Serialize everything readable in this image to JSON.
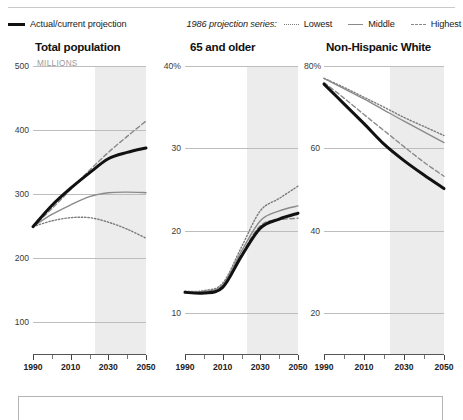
{
  "legend": {
    "actual_label": "Actual/current projection",
    "series_group_label": "1986 projection series:",
    "lowest_label": "Lowest",
    "middle_label": "Middle",
    "highest_label": "Highest"
  },
  "colors": {
    "actual": "#111111",
    "middle": "#8a8a8a",
    "lowest": "#7a7a7a",
    "highest": "#8a8a8a",
    "gridline": "#bdbdbd",
    "shade": "#ececec",
    "subtitle": "#9b9b9b"
  },
  "chart_data": [
    {
      "type": "line",
      "title": "Total population",
      "subtitle": "MILLIONS",
      "xlabel": "",
      "ylabel": "MILLIONS",
      "xlim": [
        1990,
        2050
      ],
      "ylim": [
        50,
        500
      ],
      "yticks": [
        500,
        400,
        300,
        200,
        100
      ],
      "ytick_labels": [
        "500",
        "400",
        "300",
        "200",
        "100"
      ],
      "xticks": [
        1990,
        2000,
        2010,
        2020,
        2030,
        2040,
        2050
      ],
      "xtick_labels": [
        "1990",
        "",
        "2010",
        "",
        "2030",
        "",
        "2050"
      ],
      "grid": true,
      "projection_shade_start": 2023,
      "x": [
        1990,
        2000,
        2010,
        2020,
        2030,
        2040,
        2050
      ],
      "series": [
        {
          "name": "Actual/current projection",
          "style": "solid-bold",
          "x": [
            1990,
            2000,
            2010,
            2020,
            2030,
            2040,
            2050
          ],
          "values": [
            249,
            282,
            309,
            333,
            355,
            365,
            372
          ]
        },
        {
          "name": "Middle",
          "style": "solid",
          "x": [
            1990,
            2000,
            2010,
            2020,
            2030,
            2040,
            2050
          ],
          "values": [
            249,
            268,
            283,
            296,
            302,
            303,
            302
          ]
        },
        {
          "name": "Lowest",
          "style": "dotted",
          "x": [
            1990,
            2000,
            2010,
            2020,
            2030,
            2040,
            2050
          ],
          "values": [
            249,
            258,
            263,
            263,
            256,
            245,
            231
          ]
        },
        {
          "name": "Highest",
          "style": "dashed",
          "x": [
            1990,
            2000,
            2010,
            2020,
            2030,
            2040,
            2050
          ],
          "values": [
            249,
            277,
            307,
            337,
            365,
            390,
            414
          ]
        }
      ]
    },
    {
      "type": "line",
      "title": "65 and older",
      "subtitle": "",
      "xlabel": "",
      "ylabel": "%",
      "xlim": [
        1990,
        2050
      ],
      "ylim": [
        5,
        40
      ],
      "yticks": [
        40,
        30,
        20,
        10
      ],
      "ytick_labels": [
        "40%",
        "30",
        "20",
        "10"
      ],
      "xticks": [
        1990,
        2000,
        2010,
        2020,
        2030,
        2040,
        2050
      ],
      "xtick_labels": [
        "1990",
        "",
        "2010",
        "",
        "2030",
        "",
        "2050"
      ],
      "grid": true,
      "projection_shade_start": 2023,
      "x": [
        1990,
        2000,
        2010,
        2020,
        2030,
        2040,
        2050
      ],
      "series": [
        {
          "name": "Actual/current projection",
          "style": "solid-bold",
          "x": [
            1990,
            2000,
            2010,
            2020,
            2030,
            2040,
            2050
          ],
          "values": [
            12.5,
            12.4,
            13.1,
            16.9,
            20.3,
            21.4,
            22.1
          ]
        },
        {
          "name": "Middle",
          "style": "solid",
          "x": [
            1990,
            2000,
            2010,
            2020,
            2030,
            2040,
            2050
          ],
          "values": [
            12.6,
            12.6,
            13.4,
            17.5,
            21.2,
            22.4,
            23.0
          ]
        },
        {
          "name": "Lowest",
          "style": "dotted",
          "x": [
            1990,
            2000,
            2010,
            2020,
            2030,
            2040,
            2050
          ],
          "values": [
            12.6,
            12.7,
            13.6,
            18.0,
            22.4,
            23.9,
            25.4
          ]
        },
        {
          "name": "Highest",
          "style": "dashed",
          "x": [
            1990,
            2000,
            2010,
            2020,
            2030,
            2040,
            2050
          ],
          "values": [
            12.5,
            12.4,
            13.2,
            17.1,
            20.6,
            21.3,
            21.5
          ]
        }
      ]
    },
    {
      "type": "line",
      "title": "Non-Hispanic White",
      "subtitle": "",
      "xlabel": "",
      "ylabel": "%",
      "xlim": [
        1990,
        2050
      ],
      "ylim": [
        10,
        80
      ],
      "yticks": [
        80,
        60,
        40,
        20
      ],
      "ytick_labels": [
        "80%",
        "60",
        "40",
        "20"
      ],
      "xticks": [
        1990,
        2000,
        2010,
        2020,
        2030,
        2040,
        2050
      ],
      "xtick_labels": [
        "1990",
        "",
        "2010",
        "",
        "2030",
        "",
        "2050"
      ],
      "grid": true,
      "projection_shade_start": 2023,
      "x": [
        1990,
        2000,
        2010,
        2020,
        2030,
        2040,
        2050
      ],
      "series": [
        {
          "name": "Actual/current projection",
          "style": "solid-bold",
          "x": [
            1990,
            2000,
            2010,
            2020,
            2030,
            2040,
            2050
          ],
          "values": [
            75.6,
            70.8,
            66.0,
            61.0,
            57.0,
            53.5,
            50.2
          ]
        },
        {
          "name": "Middle",
          "style": "solid",
          "x": [
            1990,
            2000,
            2010,
            2020,
            2030,
            2040,
            2050
          ],
          "values": [
            77.0,
            74.5,
            72.0,
            69.3,
            66.6,
            64.0,
            61.4
          ]
        },
        {
          "name": "Lowest",
          "style": "dotted",
          "x": [
            1990,
            2000,
            2010,
            2020,
            2030,
            2040,
            2050
          ],
          "values": [
            77.0,
            74.8,
            72.4,
            70.0,
            67.5,
            65.3,
            63.1
          ]
        },
        {
          "name": "Highest",
          "style": "dashed",
          "x": [
            1990,
            2000,
            2010,
            2020,
            2030,
            2040,
            2050
          ],
          "values": [
            76.0,
            72.2,
            68.2,
            64.3,
            60.4,
            56.6,
            53.2
          ]
        }
      ]
    }
  ]
}
